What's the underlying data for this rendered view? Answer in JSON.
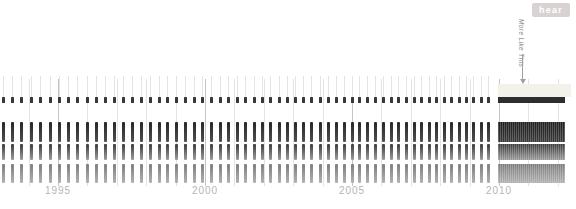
{
  "toolbar": {
    "hear_label": "hear",
    "hear_bg": "#d8d3d2",
    "hear_text_color": "#ffffff"
  },
  "annotation": {
    "label": "More Like This",
    "text_color": "#8a8a8a",
    "arrow_color": "#a0a0a0"
  },
  "chart_data": {
    "type": "event-timeline",
    "title": "",
    "xlabel": "",
    "ylabel": "",
    "x_axis": {
      "tick_years": [
        1995,
        2000,
        2005,
        2010
      ],
      "minor_years": [
        1994,
        1996,
        1997,
        1998,
        1999,
        2001,
        2002,
        2003,
        2004,
        2006,
        2007,
        2008,
        2009,
        2011,
        2012
      ],
      "year_origin": 1995,
      "year_origin_x": 58,
      "px_per_year": 29.4,
      "major_color": "#c4c4c4",
      "minor_color": "#e3e3e3",
      "label_color": "#b5b5b5"
    },
    "events": {
      "first_x": 1.5,
      "last_x": 493,
      "count": 59,
      "gap_start_px": 9.5,
      "gap_end_px": 7.2
    },
    "lanes": [
      {
        "name": "lane-ticks",
        "style": "whisker-dot",
        "whisker": {
          "top": 76,
          "height": 21,
          "color": "#e4e4e4"
        },
        "dot": {
          "top": 97,
          "height": 6,
          "width": 3,
          "color": "#383838"
        }
      },
      {
        "name": "lane-dark",
        "style": "bar",
        "top": 122,
        "height": 20,
        "width": 3,
        "color_top": "#262626",
        "color_bottom": "#505050"
      },
      {
        "name": "lane-medium",
        "style": "bar",
        "top": 144,
        "height": 16,
        "width": 3,
        "color_top": "#3c3c3c",
        "color_bottom": "#9c9c9c"
      },
      {
        "name": "lane-light",
        "style": "bar",
        "top": 164,
        "height": 19,
        "width": 3,
        "color_top": "#7e7e7e",
        "color_bottom": "#b2b2b2"
      }
    ],
    "dense_region": {
      "x_start": 498,
      "x_end": 565,
      "highlight_band": {
        "x_start": 498,
        "x_end": 571,
        "top": 84,
        "height": 13,
        "color": "#f2f2ea"
      },
      "blocks": [
        {
          "name": "dense-ticks",
          "top": 97,
          "height": 6,
          "color_top": "#2e2e2e",
          "color_bottom": "#2e2e2e",
          "striped": false
        },
        {
          "name": "dense-dark",
          "top": 122,
          "height": 20,
          "color_top": "#1f1f1f",
          "color_bottom": "#3a3a3a",
          "striped": true
        },
        {
          "name": "dense-medium",
          "top": 144,
          "height": 16,
          "color_top": "#3c3c3c",
          "color_bottom": "#9c9c9c",
          "striped": true
        },
        {
          "name": "dense-light",
          "top": 164,
          "height": 19,
          "color_top": "#7e7e7e",
          "color_bottom": "#b2b2b2",
          "striped": true
        }
      ]
    }
  }
}
